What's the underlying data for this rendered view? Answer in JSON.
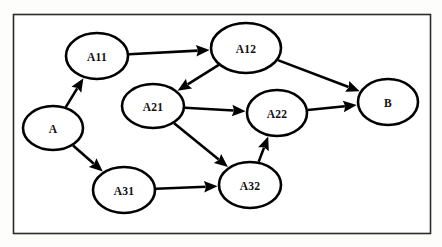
{
  "diagram": {
    "background_color": "#fdfdfb",
    "frame": {
      "name": "outer-border",
      "x": 13,
      "y": 14,
      "width": 417,
      "height": 219,
      "stroke_color": "#2b2b2b",
      "fill_color": "#ffffff"
    },
    "style": {
      "node_fill": "#ffffff",
      "node_stroke": "#000000",
      "node_stroke_width": 2.6,
      "edge_color": "#000000",
      "edge_width": 2.6,
      "label_color": "#111111"
    },
    "nodes": [
      {
        "id": "A",
        "label": "A",
        "cx": 53,
        "cy": 128,
        "rx": 30,
        "ry": 22
      },
      {
        "id": "A11",
        "label": "A11",
        "cx": 97,
        "cy": 56,
        "rx": 31,
        "ry": 23
      },
      {
        "id": "A12",
        "label": "A12",
        "cx": 246,
        "cy": 48,
        "rx": 35,
        "ry": 25
      },
      {
        "id": "A21",
        "label": "A21",
        "cx": 153,
        "cy": 106,
        "rx": 31,
        "ry": 22
      },
      {
        "id": "A22",
        "label": "A22",
        "cx": 277,
        "cy": 113,
        "rx": 30,
        "ry": 23
      },
      {
        "id": "A31",
        "label": "A31",
        "cx": 124,
        "cy": 190,
        "rx": 31,
        "ry": 23
      },
      {
        "id": "A32",
        "label": "A32",
        "cx": 250,
        "cy": 185,
        "rx": 31,
        "ry": 23
      },
      {
        "id": "B",
        "label": "B",
        "cx": 388,
        "cy": 102,
        "rx": 30,
        "ry": 23
      }
    ],
    "edges": [
      {
        "id": "e-a-a11",
        "from": "A",
        "to": "A11",
        "label": ""
      },
      {
        "id": "e-a-a31",
        "from": "A",
        "to": "A31",
        "label": ""
      },
      {
        "id": "e-a11-a12",
        "from": "A11",
        "to": "A12",
        "label": ""
      },
      {
        "id": "e-a12-a21",
        "from": "A12",
        "to": "A21",
        "label": ""
      },
      {
        "id": "e-a12-b",
        "from": "A12",
        "to": "B",
        "label": ""
      },
      {
        "id": "e-a21-a22",
        "from": "A21",
        "to": "A22",
        "label": ""
      },
      {
        "id": "e-a21-a32",
        "from": "A21",
        "to": "A32",
        "label": ""
      },
      {
        "id": "e-a31-a32",
        "from": "A31",
        "to": "A32",
        "label": ""
      },
      {
        "id": "e-a32-a22",
        "from": "A32",
        "to": "A22",
        "label": ""
      },
      {
        "id": "e-a22-b",
        "from": "A22",
        "to": "B",
        "label": ""
      }
    ]
  }
}
